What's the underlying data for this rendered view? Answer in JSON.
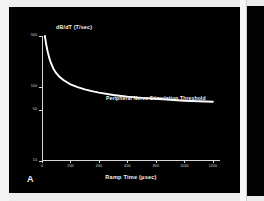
{
  "figure": {
    "panel_label": "A",
    "background_color": "#010101",
    "foreground_color": "#f2f2f2"
  },
  "chart_data": {
    "type": "line",
    "title": "",
    "xlabel": "Ramp Time (μsec)",
    "ylabel": "dB/dT (T/sec)",
    "xlim": [
      0,
      1250
    ],
    "ylim": [
      10,
      500
    ],
    "yscale": "log",
    "xscale": "linear",
    "grid": false,
    "legend": "none",
    "xticks": [
      0,
      200,
      400,
      600,
      800,
      1000,
      1200
    ],
    "xticklabels": [
      "0",
      "200",
      "400",
      "600",
      "800",
      "1000",
      "1200"
    ],
    "yticks": [
      10,
      50,
      100,
      500
    ],
    "yticklabels": [
      "10",
      "50",
      "100",
      "500"
    ],
    "annotations": [
      {
        "text": "Peripheral Nerve Stimulation Threshold",
        "x": 430,
        "y": 95
      }
    ],
    "series": [
      {
        "name": "Peripheral Nerve Stimulation Threshold",
        "color": "#ffffff",
        "x": [
          20,
          30,
          40,
          50,
          60,
          80,
          100,
          120,
          150,
          200,
          250,
          300,
          350,
          400,
          500,
          600,
          700,
          800,
          900,
          1000,
          1100,
          1200
        ],
        "y": [
          500,
          380,
          305,
          256,
          222,
          180,
          156,
          141,
          126,
          110,
          101,
          94,
          89,
          85,
          79,
          75,
          72,
          70,
          68,
          66,
          65,
          64
        ]
      }
    ]
  },
  "right_panel": {
    "visible": true
  }
}
